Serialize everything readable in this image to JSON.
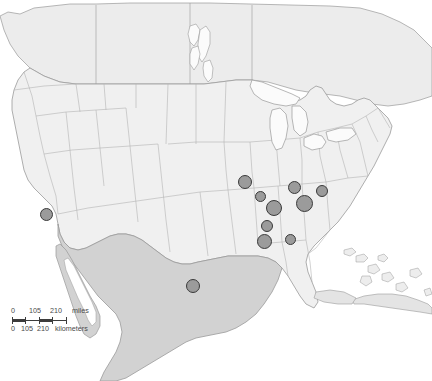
{
  "figure": {
    "type": "point-distribution-map",
    "region": "North America (contiguous United States, northern Mexico, southern Canada, Cuba and the Bahamas)",
    "background_color": "#ffffff"
  },
  "basemap": {
    "land_fill": "#f0f0f0",
    "land_fill_mexico": "#d2d2d2",
    "land_fill_canada": "#ececec",
    "lake_fill": "#fbfbfb",
    "border_color": "#9a9a9a",
    "state_border_color": "#b4b4b4",
    "ocean_fill": "#ffffff"
  },
  "markers": {
    "fill_color": "#9b9b9b",
    "outline_color": "#3a3a3a",
    "shape": "circle",
    "count": 11,
    "points": [
      {
        "id": "marker-california",
        "x": 46,
        "y": 214,
        "d": 13
      },
      {
        "id": "marker-texas",
        "x": 193,
        "y": 286,
        "d": 14
      },
      {
        "id": "marker-missouri-n",
        "x": 245,
        "y": 182,
        "d": 14
      },
      {
        "id": "marker-missouri-e",
        "x": 260,
        "y": 196,
        "d": 11
      },
      {
        "id": "marker-missouri-s",
        "x": 274,
        "y": 208,
        "d": 16
      },
      {
        "id": "marker-illinois",
        "x": 294,
        "y": 187,
        "d": 13
      },
      {
        "id": "marker-kentucky",
        "x": 304,
        "y": 203,
        "d": 17
      },
      {
        "id": "marker-tennessee-e",
        "x": 322,
        "y": 191,
        "d": 12
      },
      {
        "id": "marker-arkansas-n",
        "x": 267,
        "y": 226,
        "d": 12
      },
      {
        "id": "marker-arkansas-s",
        "x": 264,
        "y": 241,
        "d": 15
      },
      {
        "id": "marker-mississippi",
        "x": 290,
        "y": 239,
        "d": 11
      }
    ]
  },
  "scale_bar": {
    "zero_label": "0",
    "mid_label": "105",
    "max_label": "210",
    "miles_unit": "miles",
    "kilometers_unit": "kilometers",
    "km_zero_label": "0",
    "km_mid_label": "105",
    "km_max_label": "210"
  },
  "chart_data": {
    "type": "scatter",
    "title": "",
    "xlabel": "",
    "ylabel": "",
    "projection": "geographic",
    "categories": [
      "California",
      "Texas",
      "Missouri (north)",
      "Missouri (east)",
      "Missouri (south)",
      "Illinois",
      "Kentucky",
      "Tennessee (east)",
      "Arkansas (north)",
      "Arkansas (south)",
      "Mississippi"
    ],
    "values": [
      13,
      14,
      14,
      11,
      16,
      13,
      17,
      12,
      12,
      15,
      11
    ],
    "legend_position": "none",
    "grid": false
  }
}
